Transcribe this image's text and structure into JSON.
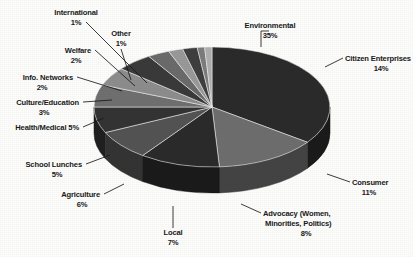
{
  "chart_data": {
    "type": "pie",
    "title": "",
    "subtitle": "",
    "xlabel": "",
    "ylabel": "",
    "legend_position": "none",
    "grid": false,
    "three_d": true,
    "unit": "%",
    "categories": [
      "Environmental",
      "Citizen Enterprises",
      "Consumer",
      "Advocacy (Women, Minorities, Politics)",
      "Local",
      "Agriculture",
      "School Lunches",
      "Health/Medical",
      "Culture/Education",
      "Info. Networks",
      "Welfare",
      "International",
      "Other"
    ],
    "values": [
      35,
      14,
      11,
      8,
      7,
      6,
      5,
      5,
      3,
      2,
      2,
      1,
      1
    ],
    "slices": [
      {
        "label": "Environmental",
        "value": 35,
        "value_text": "35%",
        "color": "#2b2b2b"
      },
      {
        "label": "Citizen Enterprises",
        "value": 14,
        "value_text": "14%",
        "color": "#6e6e6e"
      },
      {
        "label": "Consumer",
        "value": 11,
        "value_text": "11%",
        "color": "#2b2b2b"
      },
      {
        "label": "Advocacy",
        "value": 8,
        "value_text": "8%",
        "color": "#545454"
      },
      {
        "label": "Local",
        "value": 7,
        "value_text": "7%",
        "color": "#343434"
      },
      {
        "label": "Agriculture",
        "value": 6,
        "value_text": "6%",
        "color": "#707070"
      },
      {
        "label": "School Lunches",
        "value": 5,
        "value_text": "5%",
        "color": "#8d8d8d"
      },
      {
        "label": "Health/Medical",
        "value": 5,
        "value_text": "5%",
        "color": "#3a3a3a"
      },
      {
        "label": "Culture/Education",
        "value": 3,
        "value_text": "3%",
        "color": "#6b6b6b"
      },
      {
        "label": "Info. Networks",
        "value": 2,
        "value_text": "2%",
        "color": "#9a9a9a"
      },
      {
        "label": "Welfare",
        "value": 2,
        "value_text": "2%",
        "color": "#3f3f3f"
      },
      {
        "label": "International",
        "value": 1,
        "value_text": "1%",
        "color": "#7d7d7d"
      },
      {
        "label": "Other",
        "value": 1,
        "value_text": "1%",
        "color": "#b0b0b0"
      }
    ]
  },
  "labels": {
    "environmental": {
      "name": "Environmental",
      "value": "35%"
    },
    "citizen_enterprises": {
      "name": "Citizen Enterprises",
      "value": "14%"
    },
    "consumer": {
      "name": "Consumer",
      "value": "11%"
    },
    "advocacy_line1": "Advocacy (Women,",
    "advocacy_line2": "Minorities, Politics)",
    "advocacy_value": "8%",
    "local": {
      "name": "Local",
      "value": "7%"
    },
    "agriculture": {
      "name": "Agriculture",
      "value": "6%"
    },
    "school_lunches": {
      "name": "School Lunches",
      "value": "5%"
    },
    "health_medical": {
      "name": "Health/Medical 5%"
    },
    "culture_education": {
      "name": "Culture/Education",
      "value": "3%"
    },
    "info_networks": {
      "name": "Info. Networks",
      "value": "2%"
    },
    "welfare": {
      "name": "Welfare",
      "value": "2%"
    },
    "international": {
      "name": "International",
      "value": "1%"
    },
    "other": {
      "name": "Other",
      "value": "1%"
    }
  },
  "geometry": {
    "center_x": 212,
    "center_y": 107,
    "radius_x": 118,
    "radius_y": 60,
    "depth": 26,
    "start_angle_deg": -90
  },
  "colors": {
    "background": "#fdfdfc",
    "text": "#1a1a1a",
    "leader": "#1a1a1a",
    "dark_slice": "#2b2b2b",
    "light_slice": "#9a9a9a"
  }
}
